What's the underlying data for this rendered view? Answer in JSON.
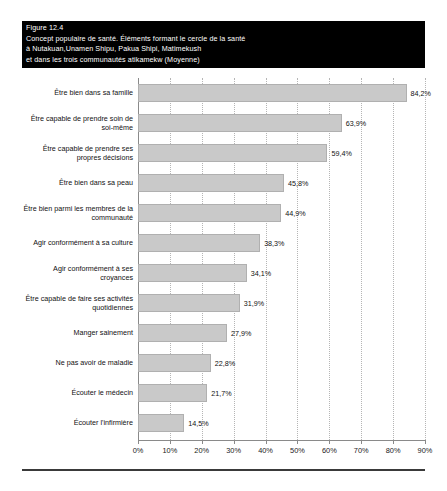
{
  "figure": {
    "banner_color": "#000000",
    "banner_text_color": "#ffffff",
    "title_lines": [
      "Figure 12.4",
      "Concept populaire de santé. Éléments formant le cercle de la santé",
      "à Nutakuan,Unamen Shipu, Pakua Shipi, Matimekush",
      "et dans les trois communautés atikamekw (Moyenne)"
    ]
  },
  "chart_data": {
    "type": "bar",
    "orientation": "horizontal",
    "title": "Concept populaire de santé. Éléments formant le cercle de la santé à Nutakuan,Unamen Shipu, Pakua Shipi, Matimekush et dans les trois communautés atikamekw (Moyenne)",
    "xlabel": "",
    "ylabel": "",
    "xlim": [
      0,
      90
    ],
    "grid": true,
    "legend": false,
    "bar_color": "#c9c9c9",
    "bar_border_color": "#b0b0b0",
    "value_suffix": "%",
    "decimal_separator": ",",
    "categories": [
      "Être bien dans sa famille",
      "Être capable de prendre soin de soi-même",
      "Être capable de prendre ses propres décisions",
      "Être bien dans sa peau",
      "Être bien parmi les membres de la communauté",
      "Agir conformément à sa culture",
      "Agir conformément à ses croyances",
      "Être capable de faire ses activités quotidiennes",
      "Manger sainement",
      "Ne pas avoir de maladie",
      "Écouter le médecin",
      "Écouter l'infirmière"
    ],
    "values": [
      84.2,
      63.9,
      59.4,
      45.8,
      44.9,
      38.3,
      34.1,
      31.9,
      27.9,
      22.8,
      21.7,
      14.5
    ],
    "value_labels": [
      "84,2%",
      "63,9%",
      "59,4%",
      "45,8%",
      "44,9%",
      "38,3%",
      "34,1%",
      "31,9%",
      "27,9%",
      "22,8%",
      "21,7%",
      "14,5%"
    ],
    "category_label_lines": [
      [
        "Être bien dans sa famille"
      ],
      [
        "Être capable de prendre soin de",
        "soi-même"
      ],
      [
        "Être capable de prendre ses",
        "propres décisions"
      ],
      [
        "Être bien dans sa peau"
      ],
      [
        "Être bien parmi les membres de la",
        "communauté"
      ],
      [
        "Agir conformément à sa culture"
      ],
      [
        "Agir conformément à ses",
        "croyances"
      ],
      [
        "Être capable de faire ses activités",
        "quotidiennes"
      ],
      [
        "Manger sainement"
      ],
      [
        "Ne pas avoir de maladie"
      ],
      [
        "Écouter le médecin"
      ],
      [
        "Écouter l'infirmière"
      ]
    ],
    "xticks": [
      0,
      10,
      20,
      30,
      40,
      50,
      60,
      70,
      80,
      90
    ],
    "xtick_labels": [
      "0%",
      "10%",
      "20%",
      "30%",
      "40%",
      "50%",
      "60%",
      "70%",
      "80%",
      "90%"
    ]
  }
}
